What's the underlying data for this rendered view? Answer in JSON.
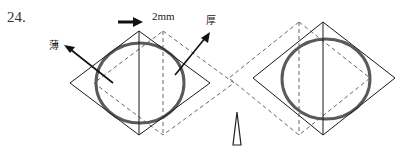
{
  "question_number": "24.",
  "shift_label": "2mm",
  "thin_label": "薄",
  "thick_label": "厚",
  "colors": {
    "solid_line": "#1a1a1a",
    "dashed_line": "#666666",
    "circle": "#5a5a5a",
    "background": "#ffffff"
  },
  "panels": [
    {
      "name": "left",
      "solid_diamond": {
        "top": [
          139,
          31
        ],
        "right": [
          210,
          83
        ],
        "bottom": [
          139,
          135
        ],
        "left": [
          70,
          83
        ]
      },
      "dashed_diamond_offset_x": 24,
      "circle": {
        "cx": 140,
        "cy": 83,
        "rx": 44,
        "ry": 40
      }
    },
    {
      "name": "right",
      "solid_diamond": {
        "top": [
          323,
          22
        ],
        "right": [
          395,
          78
        ],
        "bottom": [
          323,
          135
        ],
        "left": [
          253,
          78
        ]
      },
      "dashed_diamond_offset_x": -24,
      "circle": {
        "cx": 326,
        "cy": 79,
        "rx": 44,
        "ry": 40
      }
    }
  ]
}
